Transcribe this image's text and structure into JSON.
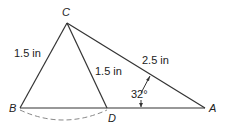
{
  "diagram": {
    "points": {
      "A": {
        "label": "A",
        "x": 205,
        "y": 108
      },
      "B": {
        "label": "B",
        "x": 20,
        "y": 108
      },
      "C": {
        "label": "C",
        "x": 67,
        "y": 23
      },
      "D": {
        "label": "D",
        "x": 107,
        "y": 108
      }
    },
    "segments": [
      {
        "from": "B",
        "to": "A"
      },
      {
        "from": "B",
        "to": "C"
      },
      {
        "from": "C",
        "to": "D"
      },
      {
        "from": "C",
        "to": "A"
      }
    ],
    "labels": {
      "bc_length": "1.5 in",
      "cd_length": "1.5 in",
      "ca_length": "2.5 in",
      "angle_a": "32°"
    },
    "colors": {
      "line": "#333333",
      "arc": "#888888"
    }
  }
}
